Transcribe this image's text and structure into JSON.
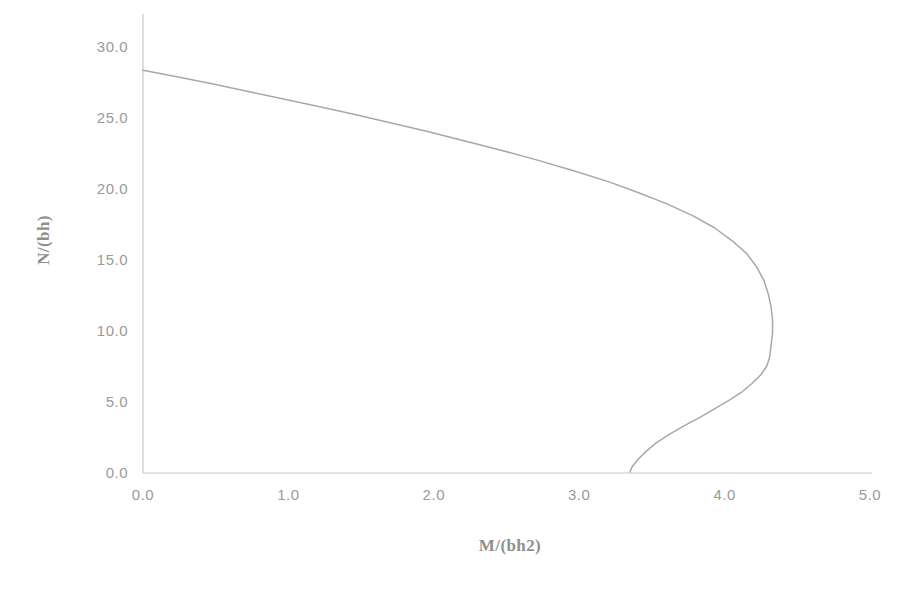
{
  "chart_data": {
    "type": "line",
    "title": "",
    "subtitle": "",
    "xlabel": "M/(bh2)",
    "ylabel": "N/(bh)",
    "xlim": [
      0.0,
      5.0
    ],
    "ylim": [
      0.0,
      30.0
    ],
    "xticks": [
      "0.0",
      "1.0",
      "2.0",
      "3.0",
      "4.0",
      "5.0"
    ],
    "xtick_values": [
      0.0,
      1.0,
      2.0,
      3.0,
      4.0,
      5.0
    ],
    "yticks": [
      "0.0",
      "5.0",
      "10.0",
      "15.0",
      "20.0",
      "25.0",
      "30.0"
    ],
    "ytick_values": [
      0.0,
      5.0,
      10.0,
      15.0,
      20.0,
      25.0,
      30.0
    ],
    "grid": false,
    "legend": null,
    "annotations": [],
    "series": [
      {
        "name": "M-N interaction curve",
        "color": "#a8a8a8",
        "points": [
          [
            0.0,
            28.3
          ],
          [
            0.1,
            28.1
          ],
          [
            0.25,
            27.8
          ],
          [
            0.45,
            27.4
          ],
          [
            0.7,
            26.85
          ],
          [
            0.95,
            26.3
          ],
          [
            1.2,
            25.75
          ],
          [
            1.45,
            25.2
          ],
          [
            1.7,
            24.6
          ],
          [
            1.95,
            24.0
          ],
          [
            2.2,
            23.35
          ],
          [
            2.45,
            22.7
          ],
          [
            2.7,
            22.0
          ],
          [
            2.95,
            21.25
          ],
          [
            3.2,
            20.45
          ],
          [
            3.4,
            19.7
          ],
          [
            3.6,
            18.9
          ],
          [
            3.78,
            18.05
          ],
          [
            3.93,
            17.2
          ],
          [
            4.05,
            16.3
          ],
          [
            4.15,
            15.4
          ],
          [
            4.22,
            14.45
          ],
          [
            4.27,
            13.5
          ],
          [
            4.3,
            12.55
          ],
          [
            4.32,
            11.6
          ],
          [
            4.33,
            10.7
          ],
          [
            4.33,
            9.8
          ],
          [
            4.32,
            8.95
          ],
          [
            4.31,
            8.1
          ],
          [
            4.29,
            7.45
          ],
          [
            4.25,
            6.85
          ],
          [
            4.19,
            6.25
          ],
          [
            4.12,
            5.65
          ],
          [
            4.03,
            5.05
          ],
          [
            3.93,
            4.45
          ],
          [
            3.83,
            3.85
          ],
          [
            3.72,
            3.25
          ],
          [
            3.62,
            2.65
          ],
          [
            3.53,
            2.05
          ],
          [
            3.46,
            1.45
          ],
          [
            3.4,
            0.85
          ],
          [
            3.36,
            0.3
          ],
          [
            3.35,
            0.0
          ]
        ]
      }
    ]
  },
  "axes": {
    "axis_color": "#c6c6c6",
    "tick_text_color": "#9a9a9a",
    "title_color": "#8f8f8f",
    "background": "#ffffff"
  }
}
